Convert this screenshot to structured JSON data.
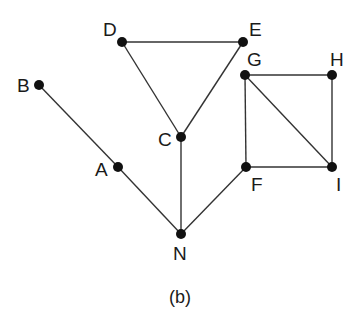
{
  "caption": "(b)",
  "nodes": [
    {
      "id": "D",
      "label": "D",
      "x": 122,
      "y": 42,
      "lx": 103,
      "ly": 20
    },
    {
      "id": "E",
      "label": "E",
      "x": 243,
      "y": 42,
      "lx": 249,
      "ly": 20
    },
    {
      "id": "B",
      "label": "B",
      "x": 39,
      "y": 85,
      "lx": 17,
      "ly": 76
    },
    {
      "id": "G",
      "label": "G",
      "x": 245,
      "y": 75,
      "lx": 247,
      "ly": 50
    },
    {
      "id": "H",
      "label": "H",
      "x": 332,
      "y": 75,
      "lx": 330,
      "ly": 50
    },
    {
      "id": "C",
      "label": "C",
      "x": 181,
      "y": 137,
      "lx": 158,
      "ly": 130
    },
    {
      "id": "A",
      "label": "A",
      "x": 118,
      "y": 167,
      "lx": 95,
      "ly": 160
    },
    {
      "id": "F",
      "label": "F",
      "x": 246,
      "y": 167,
      "lx": 251,
      "ly": 175
    },
    {
      "id": "I",
      "label": "I",
      "x": 332,
      "y": 167,
      "lx": 336,
      "ly": 175
    },
    {
      "id": "N",
      "label": "N",
      "x": 181,
      "y": 234,
      "lx": 173,
      "ly": 244
    }
  ],
  "edges": [
    [
      "D",
      "E"
    ],
    [
      "D",
      "C"
    ],
    [
      "E",
      "C"
    ],
    [
      "C",
      "N"
    ],
    [
      "B",
      "A"
    ],
    [
      "A",
      "N"
    ],
    [
      "N",
      "F"
    ],
    [
      "G",
      "H"
    ],
    [
      "H",
      "I"
    ],
    [
      "G",
      "F"
    ],
    [
      "F",
      "I"
    ],
    [
      "G",
      "I"
    ]
  ]
}
